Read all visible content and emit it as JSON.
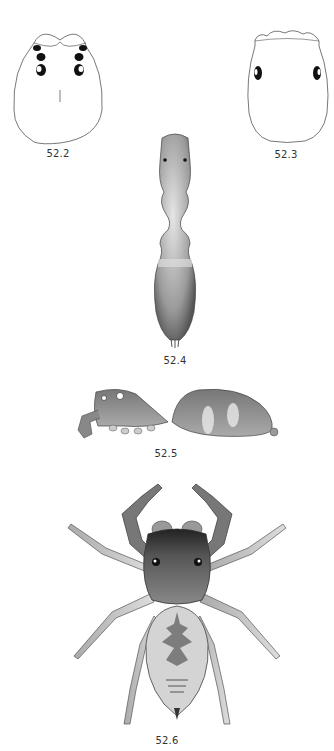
{
  "plate": {
    "figures": [
      {
        "id": "52.2",
        "label": "52.2",
        "view": "carapace outline dorsal, with eyes"
      },
      {
        "id": "52.3",
        "label": "52.3",
        "view": "carapace outline dorsal"
      },
      {
        "id": "52.4",
        "label": "52.4",
        "view": "body dorsal (ant-like)"
      },
      {
        "id": "52.5",
        "label": "52.5",
        "view": "body lateral"
      },
      {
        "id": "52.6",
        "label": "52.6",
        "view": "habitus dorsal (jumping spider)"
      }
    ]
  }
}
